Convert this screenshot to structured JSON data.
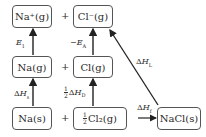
{
  "diagram": {
    "type": "Born-Haber cycle",
    "nodes": {
      "na_ion": {
        "label": "Na⁺(g)"
      },
      "cl_ion": {
        "label": "Cl⁻(g)"
      },
      "na_gas": {
        "label": "Na(g)"
      },
      "cl_gas": {
        "label": "Cl(g)"
      },
      "na_solid": {
        "label": "Na(s)"
      },
      "cl2_gas": {
        "frac_num": "1",
        "frac_den": "2",
        "label": "Cl₂(g)"
      },
      "nacl_solid": {
        "label": "NaCl(s)"
      }
    },
    "plus_sign": "+",
    "edges": {
      "ionization": {
        "symbol": "E",
        "sub": "1",
        "from": "Na(g)",
        "to": "Na⁺(g)"
      },
      "electron_affinity": {
        "prefix": "−",
        "symbol": "E",
        "sub": "A",
        "from": "Cl(g)",
        "to": "Cl⁻(g)"
      },
      "sublimation": {
        "delta": "Δ",
        "symbol": "H",
        "sub": "s",
        "from": "Na(s)",
        "to": "Na(g)"
      },
      "dissociation": {
        "frac_num": "1",
        "frac_den": "2",
        "delta": "Δ",
        "symbol": "H",
        "sub": "D",
        "from": "½Cl₂(g)",
        "to": "Cl(g)"
      },
      "formation": {
        "delta": "Δ",
        "symbol": "H",
        "sub": "f",
        "from": "½Cl₂(g)",
        "to": "NaCl(s)"
      },
      "lattice": {
        "delta": "Δ",
        "symbol": "H",
        "sub": "L",
        "from": "NaCl(s)",
        "to": "Cl⁻(g)"
      }
    },
    "colors": {
      "line": "#222222",
      "box_border": "#555555"
    }
  }
}
